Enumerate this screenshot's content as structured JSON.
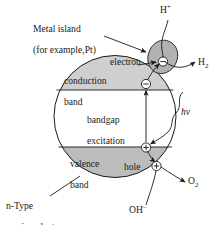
{
  "figure": {
    "colors": {
      "particle_fill": "#cfcfcf",
      "band_fill": "#bcbcbc",
      "bandgap_fill": "#ffffff",
      "metal_island_fill": "#b2b2b2",
      "stroke": "#1a1a1a",
      "text": "#1a1a1a"
    }
  },
  "labels": {
    "metal_island_line1": "Metal island",
    "metal_island_line2": "(for example,Pt)",
    "conduction_band_line1": "conduction",
    "conduction_band_line2": "band",
    "valence_band_line1": "valence",
    "valence_band_line2": "band",
    "bandgap_line1": "bandgap",
    "bandgap_line2": "excitation",
    "electron": "electron",
    "hole": "hole",
    "photon": "hv",
    "n_type_line1": "n-Type",
    "n_type_line2": "semiconductor"
  },
  "species": {
    "proton": {
      "symbol": "H",
      "charge": "+"
    },
    "hydrogen": {
      "symbol": "H",
      "subscript": "2"
    },
    "hydroxide": {
      "symbol": "OH",
      "charge": "–"
    },
    "oxygen": {
      "symbol": "O",
      "subscript": "2"
    }
  },
  "charge_carriers": {
    "electron_glyph": "⊖",
    "hole_glyph": "⊕",
    "electron_on_band_edge": "⊖",
    "electron_on_metal": "⊖",
    "hole_on_band_edge": "⊕",
    "hole_at_surface": "⊕"
  }
}
